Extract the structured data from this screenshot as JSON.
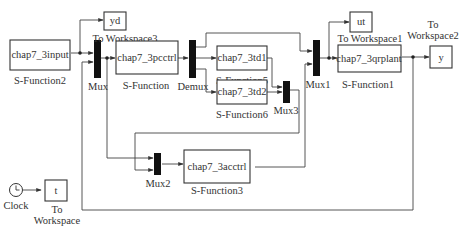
{
  "diagram": {
    "type": "simulink-block-diagram",
    "blocks": [
      {
        "id": "sfun2",
        "inner": "chap7_3input",
        "label": "S-Function2"
      },
      {
        "id": "mux",
        "inner": "",
        "label": "Mux"
      },
      {
        "id": "yd",
        "inner": "yd",
        "label": "To Workspace3"
      },
      {
        "id": "sfun",
        "inner": "chap7_3pcctrl",
        "label": "S-Function"
      },
      {
        "id": "demux",
        "inner": "",
        "label": "Demux"
      },
      {
        "id": "sfun5",
        "inner": "chap7_3td1",
        "label": "S-Function5"
      },
      {
        "id": "sfun6",
        "inner": "chap7_3td2",
        "label": "S-Function6"
      },
      {
        "id": "mux3",
        "inner": "",
        "label": "Mux3"
      },
      {
        "id": "mux1",
        "inner": "",
        "label": "Mux1"
      },
      {
        "id": "ut",
        "inner": "ut",
        "label": "To Workspace1"
      },
      {
        "id": "sfun1",
        "inner": "chap7_3qrplant",
        "label": "S-Function1"
      },
      {
        "id": "y",
        "inner": "y",
        "label_line1": "To",
        "label_line2": "Workspace2"
      },
      {
        "id": "mux2",
        "inner": "",
        "label": "Mux2"
      },
      {
        "id": "sfun3",
        "inner": "chap7_3acctrl",
        "label": "S-Function3"
      },
      {
        "id": "clock",
        "inner": "",
        "label": "Clock"
      },
      {
        "id": "t",
        "inner": "t",
        "label_line1": "To",
        "label_line2": "Workspace"
      }
    ]
  },
  "caption_cutoff": "(a) ... Simulink ..."
}
